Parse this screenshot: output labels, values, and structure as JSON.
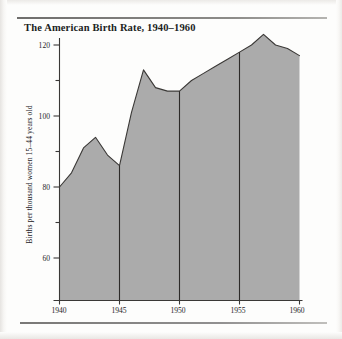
{
  "figure": {
    "title": "The American Birth Rate, 1940–1960",
    "rule_color": "#8e8d8a",
    "background_color": "#fdfdfc"
  },
  "chart_data": {
    "type": "area",
    "title": "The American Birth Rate, 1940–1960",
    "xlabel": "",
    "ylabel": "Births per thousand women 15–44 years old",
    "xlim": [
      1940,
      1960
    ],
    "ylim": [
      55,
      125
    ],
    "grid": false,
    "legend": null,
    "fill_color": "#ababab",
    "line_color": "#3a3836",
    "x_major_ticks": [
      1940,
      1945,
      1950,
      1955,
      1960
    ],
    "x_tick_labels": [
      "1940",
      "1945",
      "1950",
      "1955",
      "1960"
    ],
    "y_major_ticks": [
      60,
      80,
      100,
      120
    ],
    "y_tick_labels": [
      "60",
      "80",
      "100",
      "120"
    ],
    "y_minor_ticks": [
      70,
      90,
      110
    ],
    "divider_years": [
      1945,
      1950,
      1955
    ],
    "x": [
      1940,
      1941,
      1942,
      1943,
      1944,
      1945,
      1946,
      1947,
      1948,
      1949,
      1950,
      1951,
      1952,
      1953,
      1954,
      1955,
      1956,
      1957,
      1958,
      1959,
      1960
    ],
    "values": [
      80,
      84,
      91,
      94,
      89,
      86,
      101,
      113,
      108,
      107,
      107,
      110,
      112,
      114,
      116,
      118,
      120,
      123,
      120,
      119,
      117
    ],
    "annotations": []
  },
  "axis_labels": {
    "y_title": "Births per thousand women 15–44 years old",
    "y_ticks": [
      "120",
      "100",
      "80",
      "60"
    ],
    "x_ticks": [
      "1940",
      "1945",
      "1950",
      "1955",
      "1960"
    ]
  }
}
